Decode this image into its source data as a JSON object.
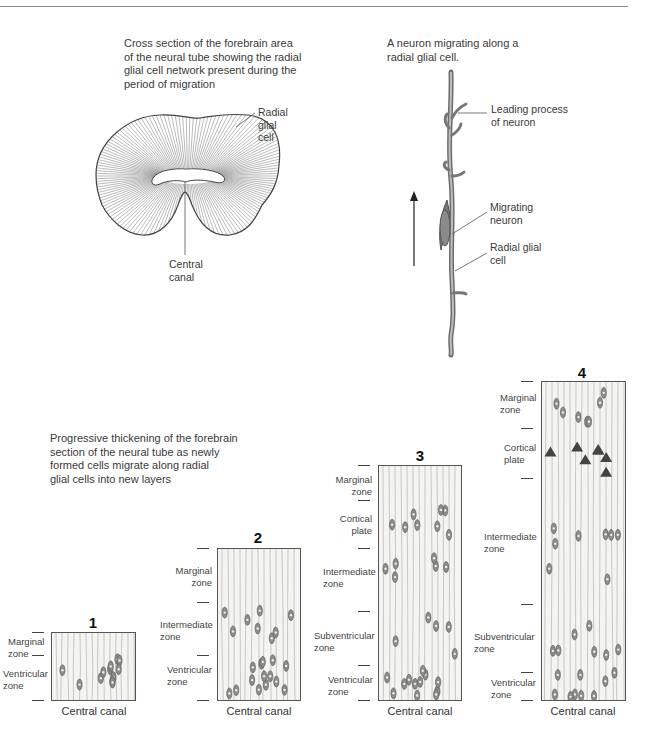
{
  "figure": {
    "top_rule": true,
    "cross_section": {
      "caption": "Cross section of the forebrain area\nof the neural tube showing the radial\nglial cell network present during the\nperiod of migration",
      "label_radial_glial": "Radial\nglial\ncell",
      "label_central_canal": "Central\ncanal"
    },
    "migrating_neuron": {
      "caption": "A neuron migrating along a\nradial glial cell.",
      "label_leading_process": "Leading process\nof neuron",
      "label_migrating_neuron": "Migrating\nneuron",
      "label_radial_glial": "Radial glial\ncell",
      "arrow_direction": "up"
    },
    "progression": {
      "caption": "Progressive thickening of the forebrain\nsection of the neural tube as newly\nformed cells migrate along radial\nglial cells into new layers",
      "panels": [
        {
          "number": "1",
          "zones": [
            "Marginal\nzone",
            "Ventricular\nzone"
          ],
          "bottom_label": "Central canal"
        },
        {
          "number": "2",
          "zones": [
            "Marginal\nzone",
            "Intermediate\nzone",
            "Ventricular\nzone"
          ],
          "bottom_label": "Central canal"
        },
        {
          "number": "3",
          "zones": [
            "Marginal\nzone",
            "Cortical\nplate",
            "Intermediate\nzone",
            "Subventricular\nzone",
            "Ventricular\nzone"
          ],
          "bottom_label": "Central canal"
        },
        {
          "number": "4",
          "zones": [
            "Marginal\nzone",
            "Cortical\nplate",
            "Intermediate\nzone",
            "Subventricular\nzone",
            "Ventricular\nzone"
          ],
          "bottom_label": "Central canal"
        }
      ]
    }
  },
  "colors": {
    "line": "#555555",
    "panel_fill": "#f4f4f1",
    "neuron": "#6a6a6a",
    "text": "#3a3a3a"
  }
}
